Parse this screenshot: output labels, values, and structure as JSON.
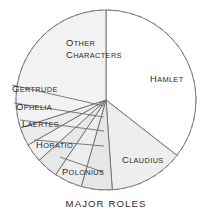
{
  "chart_data": {
    "type": "pie",
    "title": "MAJOR ROLES",
    "subtitle": "",
    "xlabel": "",
    "ylabel": "",
    "grid": false,
    "legend_position": "none",
    "labels_inside": true,
    "outer_ring": "dashed",
    "start_angle_deg": 0,
    "direction": "clockwise",
    "center": [
      106,
      100
    ],
    "radius": 90,
    "categories": [
      "Hamlet",
      "Claudius",
      "Polonius",
      "Horatio",
      "Laertes",
      "Ophelia",
      "Gertrude",
      "Other Characters"
    ],
    "values": [
      128,
      48,
      20,
      18,
      14,
      12,
      12,
      108
    ],
    "units": "degrees of arc",
    "slices": [
      {
        "name": "Hamlet",
        "label": "Hamlet",
        "label_lines": [
          "Hamlet"
        ],
        "degrees": 128,
        "start_deg": 0,
        "end_deg": 128,
        "percent": 35.6,
        "fill": "#ffffff",
        "leader": false,
        "label_x": 150,
        "label_y": 82
      },
      {
        "name": "Claudius",
        "label": "Claudius",
        "label_lines": [
          "Claudius"
        ],
        "degrees": 48,
        "start_deg": 128,
        "end_deg": 176,
        "percent": 13.3,
        "fill": "#eeeeee",
        "leader": false,
        "label_x": 122,
        "label_y": 163
      },
      {
        "name": "Polonius",
        "label": "Polonius",
        "label_lines": [
          "Polonius"
        ],
        "degrees": 20,
        "start_deg": 176,
        "end_deg": 196,
        "percent": 5.6,
        "fill": "#e6e6e6",
        "leader": true,
        "label_x": 62,
        "label_y": 175,
        "leader_from": [
          103,
          172
        ],
        "leader_to": [
          60,
          157
        ]
      },
      {
        "name": "Horatio",
        "label": "Horatio",
        "label_lines": [
          "Horatio"
        ],
        "degrees": 18,
        "start_deg": 196,
        "end_deg": 214,
        "percent": 5.0,
        "fill": "#ededed",
        "leader": true,
        "label_x": 36,
        "label_y": 148,
        "leader_from": [
          104,
          146
        ],
        "leader_to": [
          34,
          140
        ]
      },
      {
        "name": "Laertes",
        "label": "Laertes",
        "label_lines": [
          "Laertes"
        ],
        "degrees": 14,
        "start_deg": 214,
        "end_deg": 228,
        "percent": 3.9,
        "fill": "#e8e8e8",
        "leader": true,
        "label_x": 22,
        "label_y": 127,
        "leader_from": [
          104,
          131
        ],
        "leader_to": [
          20,
          120
        ]
      },
      {
        "name": "Ophelia",
        "label": "Ophelia",
        "label_lines": [
          "Ophelia"
        ],
        "degrees": 12,
        "start_deg": 228,
        "end_deg": 240,
        "percent": 3.3,
        "fill": "#f0f0f0",
        "leader": true,
        "label_x": 16,
        "label_y": 110,
        "leader_from": [
          104,
          117
        ],
        "leader_to": [
          14,
          103
        ]
      },
      {
        "name": "Gertrude",
        "label": "Gertrude",
        "label_lines": [
          "Gertrude"
        ],
        "degrees": 12,
        "start_deg": 240,
        "end_deg": 252,
        "percent": 3.3,
        "fill": "#ebebeb",
        "leader": true,
        "label_x": 12,
        "label_y": 92,
        "leader_from": [
          104,
          106
        ],
        "leader_to": [
          12,
          85
        ]
      },
      {
        "name": "Other Characters",
        "label": "Other Characters",
        "label_lines": [
          "Other",
          "Characters"
        ],
        "degrees": 108,
        "start_deg": 252,
        "end_deg": 360,
        "percent": 30.0,
        "fill": "#f2f2f2",
        "leader": false,
        "label_x": 66,
        "label_y": 46
      }
    ],
    "colors": {
      "stroke": "#6d6d6d",
      "dashed_ring": "#9a9a9a",
      "text": "#2b2b2b",
      "background": "#ffffff"
    }
  },
  "figure": {
    "caption": "MAJOR ROLES",
    "top_fragment": ""
  }
}
